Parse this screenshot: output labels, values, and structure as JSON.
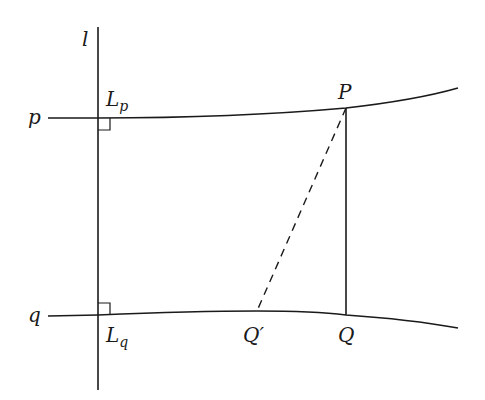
{
  "diagram": {
    "type": "geometry-figure",
    "colors": {
      "stroke": "#1a1a1a",
      "background": "#ffffff"
    },
    "labels": {
      "l": "l",
      "p": "p",
      "q": "q",
      "Lp_main": "L",
      "Lp_sub": "p",
      "Lq_main": "L",
      "Lq_sub": "q",
      "P": "P",
      "Q": "Q",
      "Qprime": "Q′"
    },
    "lines": [
      {
        "id": "l",
        "style": "solid",
        "kind": "vertical line"
      },
      {
        "id": "p",
        "style": "solid",
        "kind": "curve"
      },
      {
        "id": "q",
        "style": "solid",
        "kind": "curve"
      },
      {
        "id": "PQ",
        "style": "solid",
        "kind": "segment"
      },
      {
        "id": "PQprime",
        "style": "dashed",
        "kind": "segment"
      }
    ],
    "right_angle_markers": [
      "at L_p",
      "at L_q"
    ]
  }
}
